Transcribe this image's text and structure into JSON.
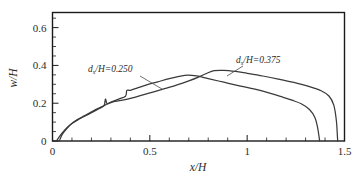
{
  "chart_data": {
    "type": "line",
    "title": "",
    "xlabel": "x/H",
    "ylabel": "w/H",
    "xlim": [
      0,
      1.5
    ],
    "ylim": [
      0,
      0.68
    ],
    "grid": false,
    "legend_position": "inline-annotations",
    "x_ticks": [
      0,
      0.5,
      1,
      1.5
    ],
    "x_tick_labels": [
      "0",
      "0.5",
      "1",
      "1.5"
    ],
    "x_minor_tick_step": 0.1,
    "y_ticks": [
      0,
      0.2,
      0.4,
      0.6
    ],
    "y_tick_labels": [
      "0",
      "0.2",
      "0.4",
      "0.6"
    ],
    "y_minor_tick_step": 0.05,
    "series": [
      {
        "name": "ds/H=0.250",
        "label_text": "d",
        "label_sub": "s",
        "label_rest": "/H=0.250",
        "color": "#3a3a3a",
        "points": [
          [
            0.02,
            0.0
          ],
          [
            0.04,
            0.03
          ],
          [
            0.06,
            0.055
          ],
          [
            0.08,
            0.075
          ],
          [
            0.1,
            0.092
          ],
          [
            0.13,
            0.112
          ],
          [
            0.16,
            0.128
          ],
          [
            0.2,
            0.15
          ],
          [
            0.24,
            0.172
          ],
          [
            0.265,
            0.188
          ],
          [
            0.272,
            0.222
          ],
          [
            0.28,
            0.198
          ],
          [
            0.3,
            0.206
          ],
          [
            0.34,
            0.222
          ],
          [
            0.375,
            0.237
          ],
          [
            0.382,
            0.268
          ],
          [
            0.4,
            0.268
          ],
          [
            0.44,
            0.282
          ],
          [
            0.48,
            0.296
          ],
          [
            0.54,
            0.313
          ],
          [
            0.6,
            0.33
          ],
          [
            0.65,
            0.342
          ],
          [
            0.695,
            0.349
          ],
          [
            0.74,
            0.344
          ],
          [
            0.8,
            0.33
          ],
          [
            0.88,
            0.311
          ],
          [
            0.96,
            0.292
          ],
          [
            1.04,
            0.274
          ],
          [
            1.12,
            0.252
          ],
          [
            1.18,
            0.233
          ],
          [
            1.23,
            0.216
          ],
          [
            1.28,
            0.196
          ],
          [
            1.32,
            0.167
          ],
          [
            1.348,
            0.125
          ],
          [
            1.362,
            0.07
          ],
          [
            1.37,
            0.018
          ],
          [
            1.372,
            0.0
          ]
        ]
      },
      {
        "name": "ds/H=0.375",
        "label_text": "d",
        "label_sub": "s",
        "label_rest": "/H=0.375",
        "color": "#3a3a3a",
        "points": [
          [
            0.035,
            0.0
          ],
          [
            0.05,
            0.035
          ],
          [
            0.07,
            0.062
          ],
          [
            0.09,
            0.085
          ],
          [
            0.12,
            0.108
          ],
          [
            0.15,
            0.126
          ],
          [
            0.19,
            0.148
          ],
          [
            0.23,
            0.17
          ],
          [
            0.27,
            0.19
          ],
          [
            0.31,
            0.207
          ],
          [
            0.36,
            0.216
          ],
          [
            0.41,
            0.228
          ],
          [
            0.46,
            0.243
          ],
          [
            0.52,
            0.26
          ],
          [
            0.58,
            0.278
          ],
          [
            0.64,
            0.297
          ],
          [
            0.7,
            0.318
          ],
          [
            0.75,
            0.338
          ],
          [
            0.79,
            0.357
          ],
          [
            0.83,
            0.372
          ],
          [
            0.88,
            0.374
          ],
          [
            0.94,
            0.368
          ],
          [
            1.0,
            0.358
          ],
          [
            1.08,
            0.344
          ],
          [
            1.16,
            0.328
          ],
          [
            1.24,
            0.31
          ],
          [
            1.32,
            0.288
          ],
          [
            1.38,
            0.266
          ],
          [
            1.42,
            0.238
          ],
          [
            1.445,
            0.19
          ],
          [
            1.458,
            0.11
          ],
          [
            1.463,
            0.035
          ],
          [
            1.465,
            0.0
          ]
        ]
      }
    ],
    "annotations": [
      {
        "name": "label-ds-250",
        "text_main": "d",
        "text_sub": "s",
        "text_rest": "/H=0.250",
        "x_px": 88,
        "y_px": 72,
        "leader_from": [
          140,
          76
        ],
        "leader_to": [
          162,
          89
        ]
      },
      {
        "name": "label-ds-375",
        "text_main": "d",
        "text_sub": "s",
        "text_rest": "/H=0.375",
        "x_px": 236,
        "y_px": 63,
        "leader_from": [
          243,
          66
        ],
        "leader_to": [
          227,
          76
        ]
      }
    ]
  }
}
